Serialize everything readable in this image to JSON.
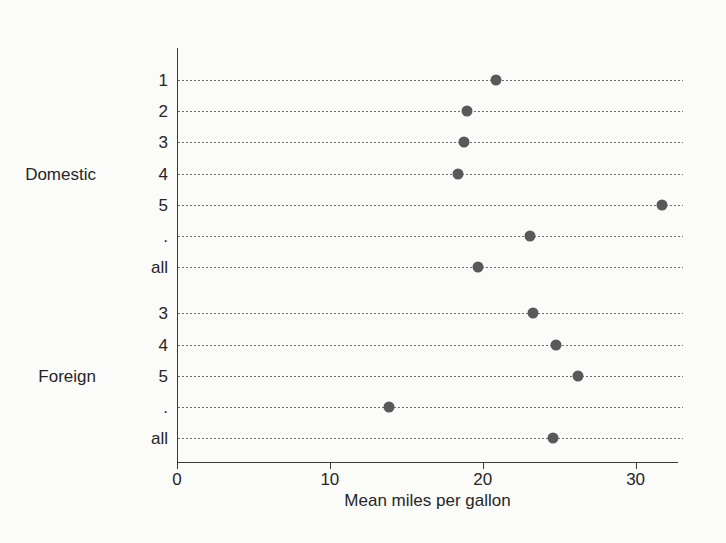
{
  "chart_data": {
    "type": "scatter",
    "title": "",
    "xlabel": "Mean miles per gallon",
    "ylabel": "",
    "xlim": [
      0,
      33.1
    ],
    "xticks": [
      0,
      10,
      20,
      30
    ],
    "xticklabels": [
      "0",
      "10",
      "20",
      "30"
    ],
    "grid": "dotted-leader-lines-per-category",
    "legend": "none",
    "groups": [
      {
        "name": "Domestic",
        "rows": [
          {
            "label": "1",
            "value": 20.9
          },
          {
            "label": "2",
            "value": 19.0
          },
          {
            "label": "3",
            "value": 18.8
          },
          {
            "label": "4",
            "value": 18.4
          },
          {
            "label": "5",
            "value": 31.7
          },
          {
            "label": ".",
            "value": 23.1
          },
          {
            "label": "all",
            "value": 19.7
          }
        ]
      },
      {
        "name": "Foreign",
        "rows": [
          {
            "label": "3",
            "value": 23.3
          },
          {
            "label": "4",
            "value": 24.8
          },
          {
            "label": "5",
            "value": 26.2
          },
          {
            "label": ".",
            "value": 13.9
          },
          {
            "label": "all",
            "value": 24.6
          }
        ]
      }
    ]
  },
  "style": {
    "background": "#fbfbfa",
    "axis_color": "#3a3a3a",
    "dot_color": "#595959",
    "leader_color": "#6d6d6d",
    "text_color": "#262626"
  }
}
